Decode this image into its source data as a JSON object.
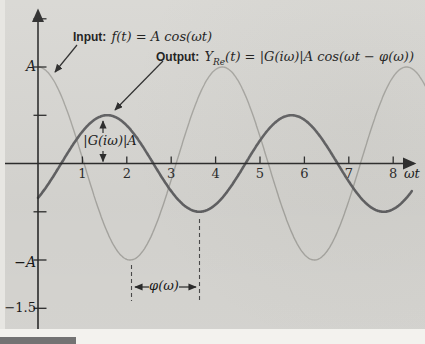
{
  "figure": {
    "background_color": "#d8d7d3",
    "footer_bar_color": "#737373"
  },
  "labels": {
    "input_prefix": "Input:",
    "input_formula": "f(t) = A cos(ωt)",
    "output_prefix": "Output:",
    "output_y": "Y",
    "output_sub": "Re",
    "output_rest": "(t) = |G(iω)|A cos(ωt − φ(ω))",
    "gain_annotation": "|G(iω)|A",
    "phase_annotation": "φ(ω)"
  },
  "axes": {
    "x_label": "ωt",
    "y_tick_label_plus_A": "A",
    "y_tick_label_minus_A": "−A",
    "y_tick_label_minus_1_5": "−1.5"
  },
  "chart_data": {
    "type": "line",
    "xlabel": "ωt",
    "ylabel": "",
    "x_ticks": [
      1,
      2,
      3,
      4,
      5,
      6,
      7,
      8
    ],
    "x_range": [
      0,
      8.7
    ],
    "y_labeled_values": {
      "A": 1,
      "−A": -1,
      "−1.5": -1.5
    },
    "y_unlabeled_tick_values": [
      1.5,
      0.5,
      -0.5
    ],
    "ylim": [
      -1.7,
      1.75
    ],
    "grid": false,
    "series": [
      {
        "name": "Input f(t) = A cos(ωt)",
        "gain": 1.0,
        "phase_shift": 0.0,
        "drawn_period": 4.15,
        "u_end": 8.72,
        "color": "#a8a7a2",
        "width": 1.4
      },
      {
        "name": "Output Y_Re(t) = |G(iω)|A cos(ωt − φ(ω))",
        "gain": 0.5,
        "phase_shift": 1.56,
        "drawn_period": 4.15,
        "u_end": 8.43,
        "color": "#616163",
        "width": 2.6
      }
    ],
    "annotations": {
      "output_amplitude": "|G(iω)|A ≈ 0.5·A (vertical double arrow at output peak near ωt ≈ 1.56)",
      "phase_lag": "φ(ω) ≈ 1.56 (between input minimum at ωt ≈ 2.08 and output minimum at ωt ≈ 3.64)"
    }
  }
}
